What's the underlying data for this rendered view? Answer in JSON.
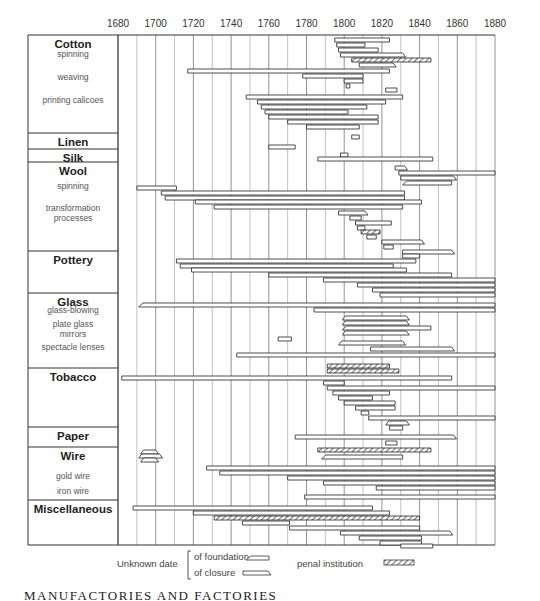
{
  "chart_data": {
    "type": "gantt",
    "title": "",
    "xlabel": "",
    "ylabel": "",
    "x_ticks": [
      1680,
      1700,
      1720,
      1740,
      1760,
      1780,
      1800,
      1820,
      1840,
      1860,
      1880
    ],
    "xlim": [
      1680,
      1880
    ],
    "grid": true,
    "categories": [
      {
        "name": "Cotton",
        "sublabels": [
          "spinning",
          "weaving",
          "printing calicoes"
        ],
        "y_top": 35,
        "y_bottom": 133
      },
      {
        "name": "Linen",
        "sublabels": [],
        "y_top": 133,
        "y_bottom": 149
      },
      {
        "name": "Silk",
        "sublabels": [],
        "y_top": 149,
        "y_bottom": 162
      },
      {
        "name": "Wool",
        "sublabels": [
          "spinning",
          "transformation processes"
        ],
        "y_top": 162,
        "y_bottom": 251
      },
      {
        "name": "Pottery",
        "sublabels": [],
        "y_top": 251,
        "y_bottom": 293
      },
      {
        "name": "Glass",
        "sublabels": [
          "glass-blowing",
          "plate glass mirrors",
          "spectacle lenses"
        ],
        "y_top": 293,
        "y_bottom": 368
      },
      {
        "name": "Tobacco",
        "sublabels": [],
        "y_top": 368,
        "y_bottom": 427
      },
      {
        "name": "Paper",
        "sublabels": [],
        "y_top": 427,
        "y_bottom": 447
      },
      {
        "name": "Wire",
        "sublabels": [
          "gold wire",
          "iron wire"
        ],
        "y_top": 447,
        "y_bottom": 500
      },
      {
        "name": "Miscellaneous",
        "sublabels": [],
        "y_top": 500,
        "y_bottom": 545
      }
    ],
    "bars": [
      {
        "y": 40,
        "start": 1795,
        "end": 1824,
        "type": "normal"
      },
      {
        "y": 45,
        "start": 1796,
        "end": 1811,
        "type": "normal"
      },
      {
        "y": 50,
        "start": 1797,
        "end": 1818,
        "type": "normal"
      },
      {
        "y": 55,
        "start": 1798,
        "end": 1831,
        "type": "closure_unknown"
      },
      {
        "y": 60,
        "start": 1804,
        "end": 1846,
        "type": "penal"
      },
      {
        "y": 65,
        "start": 1808,
        "end": 1826,
        "type": "closure_unknown"
      },
      {
        "y": 71,
        "start": 1717,
        "end": 1824,
        "type": "normal"
      },
      {
        "y": 76,
        "start": 1778,
        "end": 1810,
        "type": "normal"
      },
      {
        "y": 81,
        "start": 1800,
        "end": 1810,
        "type": "normal"
      },
      {
        "y": 86,
        "start": 1801,
        "end": 1803,
        "type": "normal"
      },
      {
        "y": 90,
        "start": 1822,
        "end": 1828,
        "type": "normal"
      },
      {
        "y": 97,
        "start": 1748,
        "end": 1831,
        "type": "normal"
      },
      {
        "y": 102,
        "start": 1754,
        "end": 1822,
        "type": "normal"
      },
      {
        "y": 107,
        "start": 1756,
        "end": 1812,
        "type": "normal"
      },
      {
        "y": 112,
        "start": 1758,
        "end": 1802,
        "type": "normal"
      },
      {
        "y": 117,
        "start": 1760,
        "end": 1818,
        "type": "normal"
      },
      {
        "y": 122,
        "start": 1770,
        "end": 1818,
        "type": "normal"
      },
      {
        "y": 127,
        "start": 1780,
        "end": 1808,
        "type": "normal"
      },
      {
        "y": 137,
        "start": 1804,
        "end": 1808,
        "type": "normal"
      },
      {
        "y": 147,
        "start": 1760,
        "end": 1774,
        "type": "normal"
      },
      {
        "y": 155,
        "start": 1798,
        "end": 1802,
        "type": "normal"
      },
      {
        "y": 159,
        "start": 1786,
        "end": 1847,
        "type": "normal"
      },
      {
        "y": 168,
        "start": 1827,
        "end": 1832,
        "type": "closure_unknown"
      },
      {
        "y": 173,
        "start": 1829,
        "end": 1880,
        "type": "normal"
      },
      {
        "y": 178,
        "start": 1830,
        "end": 1858,
        "type": "closure_unknown"
      },
      {
        "y": 183,
        "start": 1831,
        "end": 1857,
        "type": "foundation_unknown"
      },
      {
        "y": 188,
        "start": 1690,
        "end": 1711,
        "type": "normal"
      },
      {
        "y": 193,
        "start": 1703,
        "end": 1832,
        "type": "normal"
      },
      {
        "y": 198,
        "start": 1705,
        "end": 1832,
        "type": "normal"
      },
      {
        "y": 202,
        "start": 1721,
        "end": 1841,
        "type": "normal"
      },
      {
        "y": 207,
        "start": 1731,
        "end": 1831,
        "type": "normal"
      },
      {
        "y": 213,
        "start": 1797,
        "end": 1811,
        "type": "closure_unknown"
      },
      {
        "y": 218,
        "start": 1803,
        "end": 1809,
        "type": "normal"
      },
      {
        "y": 223,
        "start": 1806,
        "end": 1825,
        "type": "normal"
      },
      {
        "y": 228,
        "start": 1807,
        "end": 1811,
        "type": "normal"
      },
      {
        "y": 232,
        "start": 1809,
        "end": 1819,
        "type": "penal"
      },
      {
        "y": 237,
        "start": 1812,
        "end": 1817,
        "type": "normal"
      },
      {
        "y": 242,
        "start": 1820,
        "end": 1841,
        "type": "closure_unknown"
      },
      {
        "y": 247,
        "start": 1821,
        "end": 1826,
        "type": "normal"
      },
      {
        "y": 252,
        "start": 1831,
        "end": 1857,
        "type": "closure_unknown"
      },
      {
        "y": 256,
        "start": 1831,
        "end": 1840,
        "type": "normal"
      },
      {
        "y": 261,
        "start": 1711,
        "end": 1838,
        "type": "normal"
      },
      {
        "y": 266,
        "start": 1713,
        "end": 1826,
        "type": "normal"
      },
      {
        "y": 270,
        "start": 1719,
        "end": 1833,
        "type": "normal"
      },
      {
        "y": 275,
        "start": 1760,
        "end": 1857,
        "type": "normal"
      },
      {
        "y": 280,
        "start": 1789,
        "end": 1880,
        "type": "normal"
      },
      {
        "y": 285,
        "start": 1807,
        "end": 1880,
        "type": "normal"
      },
      {
        "y": 290,
        "start": 1815,
        "end": 1880,
        "type": "normal"
      },
      {
        "y": 295,
        "start": 1819,
        "end": 1880,
        "type": "normal"
      },
      {
        "y": 305,
        "start": 1691,
        "end": 1880,
        "type": "foundation_unknown"
      },
      {
        "y": 310,
        "start": 1784,
        "end": 1880,
        "type": "normal"
      },
      {
        "y": 318,
        "start": 1799,
        "end": 1833,
        "type": "both_unknown"
      },
      {
        "y": 323,
        "start": 1799,
        "end": 1833,
        "type": "both_unknown"
      },
      {
        "y": 328,
        "start": 1799,
        "end": 1846,
        "type": "foundation_unknown"
      },
      {
        "y": 333,
        "start": 1799,
        "end": 1833,
        "type": "both_unknown"
      },
      {
        "y": 339,
        "start": 1765,
        "end": 1772,
        "type": "normal"
      },
      {
        "y": 343,
        "start": 1797,
        "end": 1831,
        "type": "both_unknown"
      },
      {
        "y": 349,
        "start": 1814,
        "end": 1857,
        "type": "closure_unknown"
      },
      {
        "y": 355,
        "start": 1743,
        "end": 1880,
        "type": "normal"
      },
      {
        "y": 366,
        "start": 1791,
        "end": 1824,
        "type": "penal"
      },
      {
        "y": 371,
        "start": 1791,
        "end": 1829,
        "type": "penal"
      },
      {
        "y": 378,
        "start": 1682,
        "end": 1857,
        "type": "normal"
      },
      {
        "y": 383,
        "start": 1789,
        "end": 1800,
        "type": "normal"
      },
      {
        "y": 388,
        "start": 1791,
        "end": 1880,
        "type": "normal"
      },
      {
        "y": 393,
        "start": 1794,
        "end": 1824,
        "type": "normal"
      },
      {
        "y": 398,
        "start": 1797,
        "end": 1815,
        "type": "normal"
      },
      {
        "y": 403,
        "start": 1800,
        "end": 1827,
        "type": "normal"
      },
      {
        "y": 408,
        "start": 1806,
        "end": 1827,
        "type": "normal"
      },
      {
        "y": 413,
        "start": 1809,
        "end": 1813,
        "type": "normal"
      },
      {
        "y": 418,
        "start": 1813,
        "end": 1880,
        "type": "normal"
      },
      {
        "y": 423,
        "start": 1822,
        "end": 1833,
        "type": "both_unknown"
      },
      {
        "y": 428,
        "start": 1824,
        "end": 1831,
        "type": "normal"
      },
      {
        "y": 437,
        "start": 1774,
        "end": 1858,
        "type": "closure_unknown"
      },
      {
        "y": 443,
        "start": 1822,
        "end": 1828,
        "type": "normal"
      },
      {
        "y": 450,
        "start": 1786,
        "end": 1846,
        "type": "penal"
      },
      {
        "y": 457,
        "start": 1788,
        "end": 1831,
        "type": "foundation_unknown"
      },
      {
        "y": 452,
        "start": 1692,
        "end": 1700,
        "type": "both_unknown"
      },
      {
        "y": 456,
        "start": 1691,
        "end": 1702,
        "type": "both_unknown"
      },
      {
        "y": 460,
        "start": 1692,
        "end": 1700,
        "type": "both_unknown"
      },
      {
        "y": 468,
        "start": 1727,
        "end": 1880,
        "type": "normal"
      },
      {
        "y": 473,
        "start": 1734,
        "end": 1880,
        "type": "normal"
      },
      {
        "y": 478,
        "start": 1770,
        "end": 1880,
        "type": "normal"
      },
      {
        "y": 483,
        "start": 1789,
        "end": 1880,
        "type": "normal"
      },
      {
        "y": 488,
        "start": 1817,
        "end": 1880,
        "type": "normal"
      },
      {
        "y": 497,
        "start": 1779,
        "end": 1880,
        "type": "normal"
      },
      {
        "y": 508,
        "start": 1688,
        "end": 1815,
        "type": "normal"
      },
      {
        "y": 513,
        "start": 1720,
        "end": 1824,
        "type": "normal"
      },
      {
        "y": 518,
        "start": 1731,
        "end": 1840,
        "type": "penal"
      },
      {
        "y": 523,
        "start": 1746,
        "end": 1771,
        "type": "normal"
      },
      {
        "y": 528,
        "start": 1771,
        "end": 1840,
        "type": "normal"
      },
      {
        "y": 533,
        "start": 1798,
        "end": 1856,
        "type": "closure_unknown"
      },
      {
        "y": 538,
        "start": 1808,
        "end": 1841,
        "type": "normal"
      },
      {
        "y": 543,
        "start": 1819,
        "end": 1841,
        "type": "normal"
      },
      {
        "y": 546,
        "start": 1830,
        "end": 1847,
        "type": "normal"
      }
    ],
    "legend": {
      "unknown_label": "Unknown date",
      "foundation_label": "of foundation",
      "closure_label": "of closure",
      "penal_label": "penal institution"
    }
  },
  "page_footer": "MANUFACTORIES AND FACTORIES"
}
